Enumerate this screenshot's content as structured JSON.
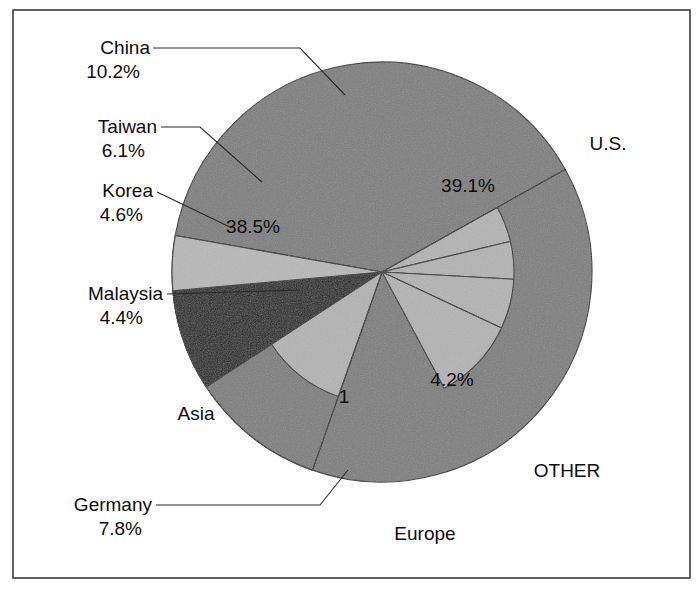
{
  "figure": {
    "background": "#ffffff",
    "frame": {
      "x": 13,
      "y": 10,
      "width": 677,
      "height": 568,
      "stroke": "#3a3a3a"
    }
  },
  "pie": {
    "cx": 382,
    "cy": 272,
    "radius": 210,
    "inner_radius": 132,
    "start_angle_deg": -80
  },
  "palette": {
    "region_gray": "#7d7d7d",
    "sub_light_gray": "#b3b3b3",
    "europe_dark": "#1f1f1f",
    "other_light": "#b8b8b8",
    "outline": "#2b2b2b",
    "text": "#0d0d0d"
  },
  "chart_data": {
    "type": "pie",
    "title": "",
    "subtitle": "",
    "xlabel": "",
    "ylabel": "",
    "legend_position": "callout-labels",
    "grid": false,
    "units": "percent",
    "total": 100,
    "regions": [
      {
        "name": "U.S.",
        "value": 39.1,
        "label": "U.S.",
        "pct_label": "39.1%",
        "color": "#7d7d7d"
      },
      {
        "name": "Asia",
        "value": 38.5,
        "label": "Asia",
        "pct_label": "38.5%",
        "color": "#7d7d7d"
      },
      {
        "name": "Europe",
        "value": 18.2,
        "label": "Europe",
        "pct_label": "1",
        "color": "#7d7d7d"
      },
      {
        "name": "OTHER",
        "value": 4.2,
        "label": "OTHER",
        "pct_label": "4.2%",
        "color": "#b8b8b8"
      }
    ],
    "categories": [
      "U.S.",
      "Asia",
      "Europe",
      "OTHER"
    ],
    "values": [
      39.1,
      38.5,
      18.2,
      4.2
    ],
    "sub_slices": [
      {
        "name": "China",
        "value": 10.2,
        "label": "China",
        "pct_label": "10.2%",
        "parent": "Asia"
      },
      {
        "name": "Taiwan",
        "value": 6.1,
        "label": "Taiwan",
        "pct_label": "6.1%",
        "parent": "Asia"
      },
      {
        "name": "Korea",
        "value": 4.6,
        "label": "Korea",
        "pct_label": "4.6%",
        "parent": "Asia"
      },
      {
        "name": "Malaysia",
        "value": 4.4,
        "label": "Malaysia",
        "pct_label": "4.4%",
        "parent": "Asia"
      },
      {
        "name": "Germany",
        "value": 7.8,
        "label": "Germany",
        "pct_label": "7.8%",
        "parent": "Europe"
      }
    ],
    "annotations": [
      {
        "text": "39.1%",
        "x": 468,
        "y": 192,
        "anchor": "middle",
        "inside": true,
        "name": "us-percent"
      },
      {
        "text": "38.5%",
        "x": 253,
        "y": 233,
        "anchor": "middle",
        "inside": true,
        "name": "asia-percent"
      },
      {
        "text": "4.2%",
        "x": 452,
        "y": 386,
        "anchor": "middle",
        "inside": true,
        "name": "other-percent"
      },
      {
        "text": "1",
        "x": 344,
        "y": 403,
        "anchor": "middle",
        "inside": true,
        "name": "europe-percent-clipped"
      }
    ]
  },
  "callouts": [
    {
      "name": "china",
      "label": "China",
      "pct": "10.2%",
      "label_x": 150,
      "label_y": 54,
      "pct_x": 140,
      "pct_y": 78,
      "anchor": "end",
      "leader": "M153,48 L300,48 L345,95"
    },
    {
      "name": "taiwan",
      "label": "Taiwan",
      "pct": "6.1%",
      "label_x": 157,
      "label_y": 133,
      "pct_x": 145,
      "pct_y": 157,
      "anchor": "end",
      "leader": "M161,127 L200,127 L262,182"
    },
    {
      "name": "korea",
      "label": "Korea",
      "pct": "4.6%",
      "label_x": 153,
      "label_y": 197,
      "pct_x": 143,
      "pct_y": 221,
      "anchor": "end",
      "leader": "M157,192 L232,228"
    },
    {
      "name": "malaysia",
      "label": "Malaysia",
      "pct": "4.4%",
      "label_x": 163,
      "label_y": 300,
      "pct_x": 143,
      "pct_y": 324,
      "anchor": "end",
      "leader": "M167,294 L300,290"
    },
    {
      "name": "germany",
      "label": "Germany",
      "pct": "7.8%",
      "label_x": 152,
      "label_y": 511,
      "pct_x": 142,
      "pct_y": 535,
      "anchor": "end",
      "leader": "M156,505 L320,505 L348,470"
    }
  ],
  "region_labels": [
    {
      "name": "us-label",
      "text": "U.S.",
      "x": 608,
      "y": 150,
      "anchor": "middle"
    },
    {
      "name": "asia-label",
      "text": "Asia",
      "x": 196,
      "y": 420,
      "anchor": "middle"
    },
    {
      "name": "other-label",
      "text": "OTHER",
      "x": 567,
      "y": 477,
      "anchor": "middle"
    },
    {
      "name": "europe-label",
      "text": "Europe",
      "x": 425,
      "y": 540,
      "anchor": "middle"
    }
  ]
}
